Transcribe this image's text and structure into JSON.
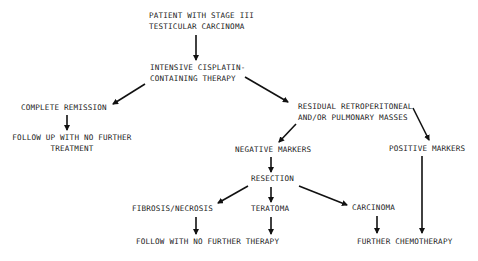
{
  "diagram": {
    "type": "flowchart",
    "nodes": {
      "patient": {
        "lines": [
          "PATIENT WITH STAGE III",
          "TESTICULAR CARCINOMA"
        ]
      },
      "therapy": {
        "lines": [
          "INTENSIVE CISPLATIN-",
          "CONTAINING THERAPY"
        ]
      },
      "complete_remission": {
        "lines": [
          "COMPLETE REMISSION"
        ]
      },
      "follow_up": {
        "lines": [
          "FOLLOW UP WITH NO FURTHER",
          "TREATMENT"
        ]
      },
      "residual_masses": {
        "lines": [
          "RESIDUAL RETROPERITONEAL",
          "AND/OR PULMONARY MASSES"
        ]
      },
      "negative_markers": {
        "lines": [
          "NEGATIVE MARKERS"
        ]
      },
      "positive_markers": {
        "lines": [
          "POSITIVE MARKERS"
        ]
      },
      "resection": {
        "lines": [
          "RESECTION"
        ]
      },
      "fibrosis_necrosis": {
        "lines": [
          "FIBROSIS/NECROSIS"
        ]
      },
      "teratoma": {
        "lines": [
          "TERATOMA"
        ]
      },
      "carcinoma": {
        "lines": [
          "CARCINOMA"
        ]
      },
      "follow_no_further": {
        "lines": [
          "FOLLOW WITH NO FURTHER THERAPY"
        ]
      },
      "further_chemo": {
        "lines": [
          "FURTHER CHEMOTHERAPY"
        ]
      }
    },
    "edges": [
      {
        "from": "patient",
        "to": "therapy"
      },
      {
        "from": "therapy",
        "to": "complete_remission"
      },
      {
        "from": "therapy",
        "to": "residual_masses"
      },
      {
        "from": "complete_remission",
        "to": "follow_up"
      },
      {
        "from": "residual_masses",
        "to": "negative_markers"
      },
      {
        "from": "residual_masses",
        "to": "positive_markers"
      },
      {
        "from": "negative_markers",
        "to": "resection"
      },
      {
        "from": "resection",
        "to": "fibrosis_necrosis"
      },
      {
        "from": "resection",
        "to": "teratoma"
      },
      {
        "from": "resection",
        "to": "carcinoma"
      },
      {
        "from": "fibrosis_necrosis",
        "to": "follow_no_further"
      },
      {
        "from": "teratoma",
        "to": "follow_no_further"
      },
      {
        "from": "carcinoma",
        "to": "further_chemo"
      },
      {
        "from": "positive_markers",
        "to": "further_chemo"
      }
    ],
    "colors": {
      "background": "#ffffff",
      "ink": "#1a1a1a"
    }
  }
}
